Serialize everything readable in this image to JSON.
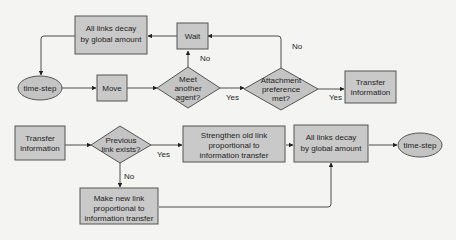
{
  "diagram": {
    "type": "flowchart",
    "colors": {
      "node_fill": "#c9c9c9",
      "node_stroke": "#555555",
      "edge": "#3a3a3a",
      "background": "#f4f4f2"
    },
    "nodes": {
      "top_decay": {
        "shape": "rect",
        "lines": [
          "All links decay",
          "by global amount"
        ]
      },
      "wait": {
        "shape": "rect",
        "lines": [
          "Wait"
        ]
      },
      "top_timestep": {
        "shape": "ellipse",
        "lines": [
          "time-step"
        ]
      },
      "move": {
        "shape": "rect",
        "lines": [
          "Move"
        ]
      },
      "meet": {
        "shape": "diamond",
        "lines": [
          "Meet",
          "another",
          "agent?"
        ]
      },
      "attach": {
        "shape": "diamond",
        "lines": [
          "Attachment",
          "preference",
          "met?"
        ]
      },
      "top_transfer": {
        "shape": "rect",
        "lines": [
          "Transfer",
          "information"
        ]
      },
      "bot_transfer": {
        "shape": "rect",
        "lines": [
          "Transfer",
          "information"
        ]
      },
      "prev": {
        "shape": "diamond",
        "lines": [
          "Previous",
          "link exists?"
        ]
      },
      "strengthen": {
        "shape": "rect",
        "lines": [
          "Strengthen old link",
          "proportional to",
          "information transfer"
        ]
      },
      "bot_decay": {
        "shape": "rect",
        "lines": [
          "All links decay",
          "by global amount"
        ]
      },
      "bot_timestep": {
        "shape": "ellipse",
        "lines": [
          "time-step"
        ]
      },
      "newlink": {
        "shape": "rect",
        "lines": [
          "Make new link",
          "proportional to",
          "information transfer"
        ]
      }
    },
    "edge_labels": {
      "meet_no": "No",
      "meet_yes": "Yes",
      "attach_no": "No",
      "attach_yes": "Yes",
      "prev_yes": "Yes",
      "prev_no": "No"
    },
    "edges": [
      {
        "from": "top_timestep",
        "to": "move"
      },
      {
        "from": "move",
        "to": "meet"
      },
      {
        "from": "meet",
        "to": "wait",
        "label": "No"
      },
      {
        "from": "meet",
        "to": "attach",
        "label": "Yes"
      },
      {
        "from": "attach",
        "to": "wait",
        "label": "No"
      },
      {
        "from": "attach",
        "to": "top_transfer",
        "label": "Yes"
      },
      {
        "from": "wait",
        "to": "top_decay"
      },
      {
        "from": "top_decay",
        "to": "top_timestep"
      },
      {
        "from": "bot_transfer",
        "to": "prev"
      },
      {
        "from": "prev",
        "to": "strengthen",
        "label": "Yes"
      },
      {
        "from": "prev",
        "to": "newlink",
        "label": "No"
      },
      {
        "from": "strengthen",
        "to": "bot_decay"
      },
      {
        "from": "newlink",
        "to": "bot_decay"
      },
      {
        "from": "bot_decay",
        "to": "bot_timestep"
      }
    ]
  }
}
